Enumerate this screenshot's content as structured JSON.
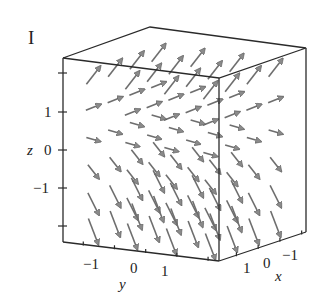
{
  "figure": {
    "panel_label": "I"
  },
  "colors": {
    "box": "#2a2a2a",
    "arrow": "#6e6e6e",
    "arrow_head": "#8a8a8a",
    "text": "#222222"
  },
  "chart_data": {
    "type": "vector_field_3d",
    "title": "I",
    "axes": {
      "x": {
        "label": "x",
        "ticks": [
          1,
          0,
          -1
        ],
        "tick_labels": [
          "1",
          "0",
          "−1"
        ],
        "range": [
          -2,
          2
        ]
      },
      "y": {
        "label": "y",
        "ticks": [
          -1,
          0,
          1
        ],
        "tick_labels": [
          "−1",
          "0",
          "1"
        ],
        "range": [
          -2,
          2
        ]
      },
      "z": {
        "label": "z",
        "ticks": [
          1,
          0,
          -1
        ],
        "tick_labels": [
          "1",
          "0",
          "−1"
        ],
        "range": [
          -2,
          2
        ]
      }
    },
    "grid": false,
    "legend": null
  },
  "labels": {
    "z_axis": "z",
    "z_ticks": [
      "1",
      "0",
      "−1"
    ],
    "y_axis": "y",
    "y_ticks": [
      "−1",
      "0",
      "1"
    ],
    "x_axis": "x",
    "x_ticks": [
      "1",
      "0",
      "−1"
    ]
  }
}
